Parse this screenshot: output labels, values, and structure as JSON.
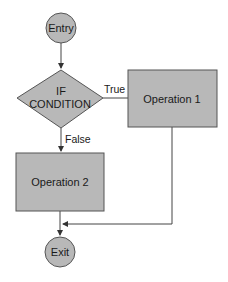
{
  "diagram": {
    "type": "flowchart",
    "colors": {
      "fill": "#b8b8b8",
      "stroke": "#4a4a4a",
      "text": "#1a1a1a",
      "background": "#ffffff"
    },
    "nodes": {
      "entry": {
        "shape": "circle",
        "label": "Entry"
      },
      "condition": {
        "shape": "diamond",
        "label_line1": "IF",
        "label_line2": "CONDITION"
      },
      "operation1": {
        "shape": "rectangle",
        "label": "Operation 1"
      },
      "operation2": {
        "shape": "rectangle",
        "label": "Operation 2"
      },
      "exit": {
        "shape": "circle",
        "label": "Exit"
      }
    },
    "edges": {
      "true_label": "True",
      "false_label": "False"
    }
  }
}
